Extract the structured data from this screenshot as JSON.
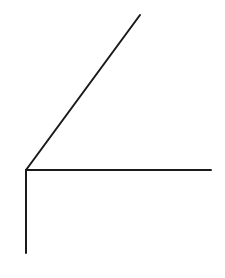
{
  "diagram": {
    "background": "#ffffff",
    "stroke_color": "#1a1a1a",
    "stroke_width": 2,
    "vertex": {
      "x": 26,
      "y": 170
    },
    "rays": [
      {
        "name": "diagonal-ray",
        "x1": 26,
        "y1": 170,
        "x2": 140,
        "y2": 15
      },
      {
        "name": "horizontal-ray",
        "x1": 26,
        "y1": 170,
        "x2": 211,
        "y2": 170
      },
      {
        "name": "vertical-ray",
        "x1": 26,
        "y1": 170,
        "x2": 26,
        "y2": 253
      }
    ]
  }
}
